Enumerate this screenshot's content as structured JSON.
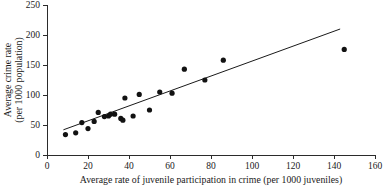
{
  "chart_data": {
    "type": "scatter",
    "title": "",
    "xlabel": "Average rate of juvenile participation in crime (per 1000 juveniles)",
    "ylabel_line1": "Average crime rate",
    "ylabel_line2": "(per 1000 population)",
    "xlim": [
      0,
      160
    ],
    "ylim": [
      0,
      250
    ],
    "xticks": [
      0,
      20,
      40,
      60,
      80,
      100,
      120,
      140,
      160
    ],
    "yticks": [
      0,
      50,
      100,
      150,
      200,
      250
    ],
    "xtick_labels": [
      "0",
      "20",
      "40",
      "60",
      "80",
      "100",
      "120",
      "140",
      "160"
    ],
    "ytick_labels": [
      "0",
      "50",
      "100",
      "150",
      "200",
      "250"
    ],
    "grid": false,
    "legend": "none",
    "marker_color": "#121212",
    "line_color": "#1a1a1a",
    "axis_color": "#2b2b2b",
    "points": [
      {
        "x": 9,
        "y": 34
      },
      {
        "x": 14,
        "y": 37
      },
      {
        "x": 17,
        "y": 54
      },
      {
        "x": 20,
        "y": 44
      },
      {
        "x": 23,
        "y": 56
      },
      {
        "x": 25,
        "y": 71
      },
      {
        "x": 28,
        "y": 64
      },
      {
        "x": 30,
        "y": 65
      },
      {
        "x": 31,
        "y": 68
      },
      {
        "x": 33,
        "y": 68
      },
      {
        "x": 36,
        "y": 61
      },
      {
        "x": 37,
        "y": 58
      },
      {
        "x": 38,
        "y": 95
      },
      {
        "x": 42,
        "y": 65
      },
      {
        "x": 45,
        "y": 101
      },
      {
        "x": 50,
        "y": 75
      },
      {
        "x": 55,
        "y": 105
      },
      {
        "x": 61,
        "y": 103
      },
      {
        "x": 67,
        "y": 143
      },
      {
        "x": 77,
        "y": 125
      },
      {
        "x": 86,
        "y": 158
      },
      {
        "x": 145,
        "y": 176
      }
    ],
    "trend_line": {
      "x1": 8,
      "y1": 42,
      "x2": 143,
      "y2": 210
    }
  }
}
